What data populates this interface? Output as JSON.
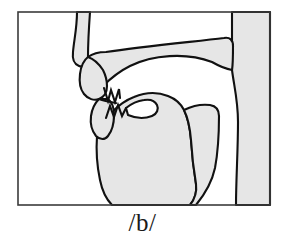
{
  "figure": {
    "name": "sagittal-vocal-tract-diagram",
    "phoneme_label": "/b/",
    "frame": {
      "border_color": "#3b3b3b",
      "fill_color": "#ffffff",
      "x": 18,
      "y": 12,
      "width": 252,
      "height": 193
    },
    "colors": {
      "tissue_fill": "#e6e6e6",
      "outline": "#111111",
      "airway_fill": "#ffffff",
      "label_color": "#1a1a1a",
      "frame_border": "#3b3b3b"
    },
    "structures": [
      {
        "name": "nasal-passage",
        "fill": "#e6e6e6",
        "label": "nasal passage"
      },
      {
        "name": "upper-lip",
        "fill": "#e6e6e6",
        "label": "upper lip"
      },
      {
        "name": "hard-palate",
        "fill": "#e6e6e6",
        "label": "hard palate"
      },
      {
        "name": "velum",
        "fill": "#e6e6e6",
        "label": "velum (soft palate), raised"
      },
      {
        "name": "upper-teeth",
        "fill": "#ffffff",
        "label": "upper teeth"
      },
      {
        "name": "lower-teeth",
        "fill": "#ffffff",
        "label": "lower teeth"
      },
      {
        "name": "lower-lip",
        "fill": "#e6e6e6",
        "label": "lower lip"
      },
      {
        "name": "tongue-body",
        "fill": "#e6e6e6",
        "label": "tongue body"
      },
      {
        "name": "oral-cavity",
        "fill": "#ffffff",
        "label": "oral cavity airway"
      },
      {
        "name": "pharyngeal-airway",
        "fill": "#ffffff",
        "label": "pharyngeal airway"
      },
      {
        "name": "pharyngeal-wall",
        "fill": "#e6e6e6",
        "label": "posterior pharyngeal wall"
      },
      {
        "name": "jaw-floor",
        "fill": "#e6e6e6",
        "label": "floor of mouth / jaw"
      }
    ]
  }
}
